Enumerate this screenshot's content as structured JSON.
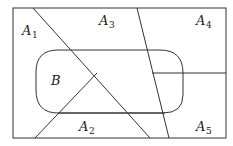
{
  "diagram": {
    "type": "set-partition-venn",
    "stroke_color": "#333333",
    "background": "#ffffff",
    "regions": [
      {
        "id": "A1",
        "base": "A",
        "sub": "1"
      },
      {
        "id": "A2",
        "base": "A",
        "sub": "2"
      },
      {
        "id": "A3",
        "base": "A",
        "sub": "3"
      },
      {
        "id": "A4",
        "base": "A",
        "sub": "4"
      },
      {
        "id": "A5",
        "base": "A",
        "sub": "5"
      }
    ],
    "set_b": {
      "label": "B"
    }
  }
}
